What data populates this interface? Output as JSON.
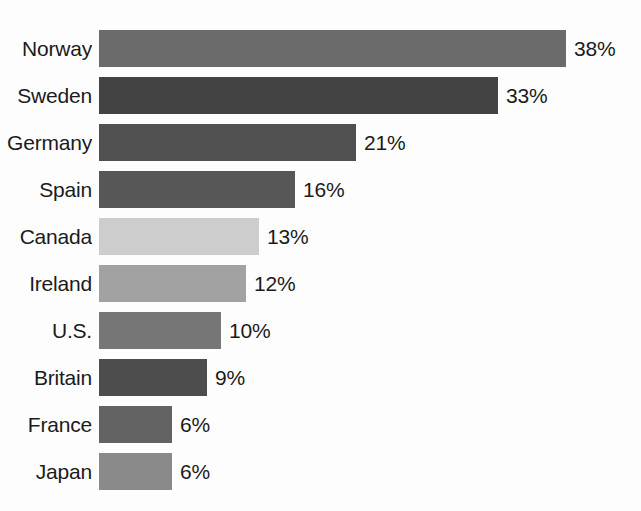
{
  "chart_data": {
    "type": "bar",
    "orientation": "horizontal",
    "title": "",
    "subtitle": "",
    "xlabel": "",
    "ylabel": "",
    "grid": false,
    "legend": "none",
    "axis_visible": false,
    "value_suffix": "%",
    "xlim": [
      0,
      38
    ],
    "categories": [
      "Norway",
      "Sweden",
      "Germany",
      "Spain",
      "Canada",
      "Ireland",
      "U.S.",
      "Britain",
      "France",
      "Japan"
    ],
    "values": [
      38,
      33,
      21,
      16,
      13,
      12,
      10,
      9,
      6,
      6
    ],
    "value_labels": [
      "38%",
      "33%",
      "21%",
      "16%",
      "13%",
      "12%",
      "10%",
      "9%",
      "6%",
      "6%"
    ],
    "bars": [
      {
        "category": "Norway",
        "value": 38,
        "label": "38%",
        "color": "#6b6b6b",
        "width_px": 467,
        "top_px": 30,
        "clipped_label": false
      },
      {
        "category": "Sweden",
        "value": 33,
        "label": "33%",
        "color": "#434343",
        "width_px": 399,
        "top_px": 77,
        "clipped_label": false
      },
      {
        "category": "Germany",
        "value": 21,
        "label": "21%",
        "color": "#505050",
        "width_px": 257,
        "top_px": 124,
        "clipped_label": true
      },
      {
        "category": "Spain",
        "value": 16,
        "label": "16%",
        "color": "#575757",
        "width_px": 196,
        "top_px": 171,
        "clipped_label": false
      },
      {
        "category": "Canada",
        "value": 13,
        "label": "13%",
        "color": "#cdcdcd",
        "width_px": 160,
        "top_px": 218,
        "clipped_label": false
      },
      {
        "category": "Ireland",
        "value": 12,
        "label": "12%",
        "color": "#a2a2a2",
        "width_px": 147,
        "top_px": 265,
        "clipped_label": false
      },
      {
        "category": "U.S.",
        "value": 10,
        "label": "10%",
        "color": "#767676",
        "width_px": 122,
        "top_px": 312,
        "clipped_label": false
      },
      {
        "category": "Britain",
        "value": 9,
        "label": "9%",
        "color": "#4d4d4d",
        "width_px": 108,
        "top_px": 359,
        "clipped_label": false
      },
      {
        "category": "France",
        "value": 6,
        "label": "6%",
        "color": "#636363",
        "width_px": 73,
        "top_px": 406,
        "clipped_label": false
      },
      {
        "category": "Japan",
        "value": 6,
        "label": "6%",
        "color": "#8a8a8a",
        "width_px": 73,
        "top_px": 453,
        "clipped_label": false
      }
    ]
  },
  "colors": {
    "background": "#fdfdfd",
    "text": "#1b1b1b"
  }
}
